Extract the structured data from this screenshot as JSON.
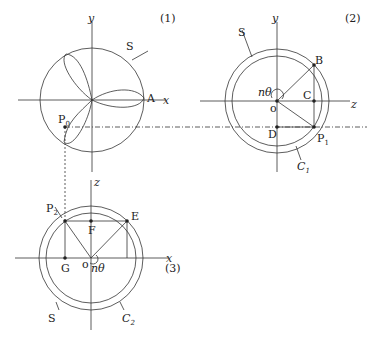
{
  "panels": [
    {
      "id": "1",
      "label": "(1)",
      "axes": {
        "x": "x",
        "y": "y"
      },
      "points": [
        "S",
        "A",
        "P0"
      ],
      "curve": "three-petal rose inscribed in circle S"
    },
    {
      "id": "2",
      "label": "(2)",
      "axes": {
        "x": "z",
        "y": "y"
      },
      "points": [
        "S",
        "B",
        "C",
        "D",
        "o",
        "P1",
        "C1"
      ],
      "angle": "nθ"
    },
    {
      "id": "3",
      "label": "(3)",
      "axes": {
        "x": "x",
        "y": "z"
      },
      "points": [
        "P2",
        "E",
        "F",
        "G",
        "o",
        "S",
        "C2"
      ],
      "angle": "nθ"
    }
  ],
  "labels": {
    "p1_num": "(1)",
    "p2_num": "(2)",
    "p3_num": "(3)",
    "y": "y",
    "x": "x",
    "z": "z",
    "S": "S",
    "A": "A",
    "P": "P",
    "sub0": "0",
    "sub1": "1",
    "sub2": "2",
    "B": "B",
    "C": "C",
    "D": "D",
    "o": "o",
    "ntheta": "nθ",
    "E": "E",
    "F": "F",
    "G": "G",
    "Cc": "C"
  }
}
